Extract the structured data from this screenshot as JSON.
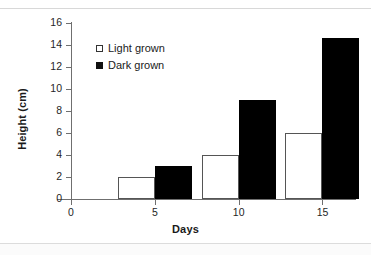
{
  "chart_data": {
    "type": "bar",
    "title": "",
    "xlabel": "Days",
    "ylabel": "Height (cm)",
    "categories": [
      "5",
      "10",
      "15"
    ],
    "x": [
      5,
      10,
      15
    ],
    "series": [
      {
        "name": "Light grown",
        "values": [
          2,
          4,
          6
        ],
        "color": "#ffffff",
        "marker": "open-square"
      },
      {
        "name": "Dark grown",
        "values": [
          3,
          9,
          14.6
        ],
        "color": "#000000",
        "marker": "filled-square"
      }
    ],
    "ylim": [
      0,
      16
    ],
    "yticks": [
      0,
      2,
      4,
      6,
      8,
      10,
      12,
      14,
      16
    ],
    "ytick_labels": [
      "0",
      "2",
      "4",
      "6",
      "8",
      "10",
      "12",
      "14",
      "16"
    ],
    "xlim": [
      0,
      17
    ],
    "xticks": [
      0,
      5,
      10,
      15
    ],
    "xtick_labels": [
      "0",
      "5",
      "10",
      "15"
    ],
    "grid": false,
    "legend_position": "upper-left-inside"
  },
  "axes": {
    "y_label": "Height (cm)",
    "x_label": "Days"
  },
  "legend": {
    "items": [
      {
        "label": "Light grown",
        "swatch": "open-square"
      },
      {
        "label": "Dark grown",
        "swatch": "filled-square"
      }
    ]
  }
}
